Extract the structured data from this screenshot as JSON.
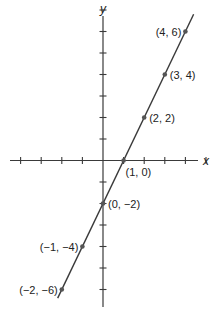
{
  "chart_data": {
    "type": "line",
    "title": "",
    "xlabel": "x",
    "ylabel": "y",
    "xlim": [
      -5,
      7
    ],
    "ylim": [
      -7,
      7
    ],
    "grid": false,
    "x_ticks": [
      -4,
      -3,
      -2,
      -1,
      1,
      2,
      3,
      4,
      5
    ],
    "y_ticks": [
      -6,
      -5,
      -4,
      -3,
      -2,
      -1,
      1,
      2,
      3,
      4,
      5,
      6,
      7
    ],
    "series": [
      {
        "name": "y = 2x - 2",
        "line": {
          "slope": 2,
          "intercept": -2,
          "x_from": -2.2,
          "x_to": 4.4
        },
        "points": [
          {
            "x": 4,
            "y": 6,
            "label": "(4, 6)",
            "label_side": "left"
          },
          {
            "x": 3,
            "y": 4,
            "label": "(3, 4)",
            "label_side": "right"
          },
          {
            "x": 2,
            "y": 2,
            "label": "(2, 2)",
            "label_side": "right"
          },
          {
            "x": 1,
            "y": 0,
            "label": "(1, 0)",
            "label_side": "below-right"
          },
          {
            "x": 0,
            "y": -2,
            "label": "(0, −2)",
            "label_side": "right"
          },
          {
            "x": -1,
            "y": -4,
            "label": "(−1, −4)",
            "label_side": "left"
          },
          {
            "x": -2,
            "y": -6,
            "label": "(−2, −6)",
            "label_side": "left"
          }
        ]
      }
    ]
  },
  "layout": {
    "origin_px": [
      103,
      160.5
    ],
    "unit_x_px": 20.6,
    "unit_y_px": 21.5,
    "x_axis_px": [
      10,
      198
    ],
    "y_axis_px": [
      16,
      307
    ],
    "colors": {
      "axis": "#3a3a3a",
      "point": "#555555",
      "text": "#222222"
    }
  }
}
